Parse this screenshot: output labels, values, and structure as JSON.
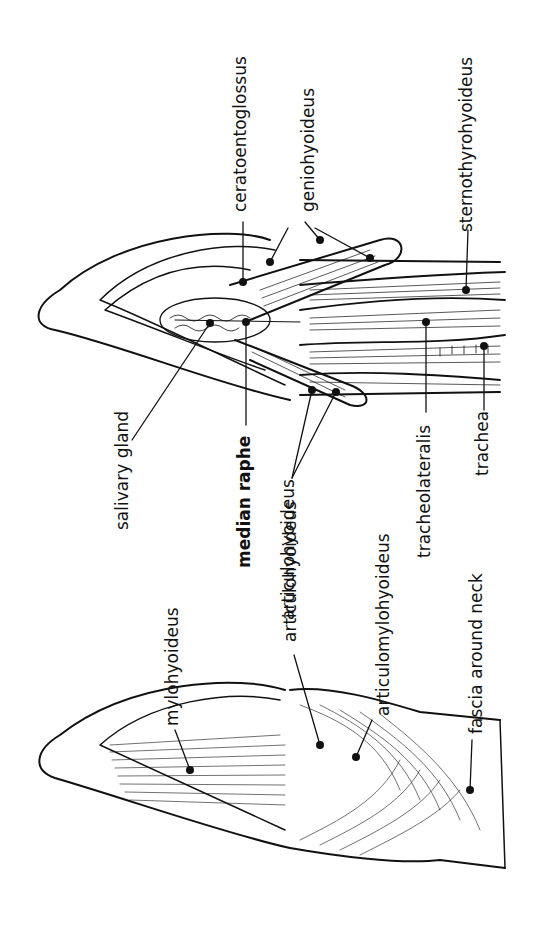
{
  "figure": {
    "colors": {
      "ink": "#111111",
      "background": "#ffffff"
    },
    "orientation": "rotated -90deg (labels read bottom-to-top)",
    "left_drawing": {
      "name": "superficial ventral view of head and neck",
      "labels": [
        {
          "id": "mylohyoideus",
          "text": "mylohyoideus"
        },
        {
          "id": "articulohyoideus",
          "text": "articulohyoideus"
        },
        {
          "id": "articulomylohyoideus",
          "text": "articulomylohyoideus"
        },
        {
          "id": "fascia-around-neck",
          "text": "fascia around neck"
        }
      ]
    },
    "right_drawing": {
      "name": "deep ventral view of head and neck",
      "labels": [
        {
          "id": "salivary-gland",
          "text": "salivary gland"
        },
        {
          "id": "median-raphe",
          "text": "median raphe"
        },
        {
          "id": "articulohyoideus",
          "text": "articulohyoideus"
        },
        {
          "id": "tracheolateralis",
          "text": "tracheolateralis"
        },
        {
          "id": "trachea",
          "text": "trachea"
        },
        {
          "id": "ceratoentoglossus",
          "text": "ceratoentoglossus"
        },
        {
          "id": "geniohyoideus",
          "text": "geniohyoideus"
        },
        {
          "id": "sternothyrohyoideus",
          "text": "sternothyrohyoideus"
        }
      ]
    }
  }
}
